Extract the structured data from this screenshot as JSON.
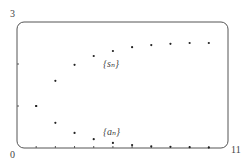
{
  "chart_data": {
    "type": "scatter",
    "title": "",
    "xlabel": "",
    "ylabel": "",
    "xlim": [
      0,
      11
    ],
    "ylim": [
      0,
      3
    ],
    "grid": false,
    "tick_labels": {
      "y_max": "3",
      "origin": "0",
      "x_max": "11"
    },
    "y_ticks": [
      1,
      2
    ],
    "x_ticks": [
      1,
      2,
      3,
      4,
      5,
      6,
      7,
      8,
      9,
      10
    ],
    "series": [
      {
        "name": "{s_n}",
        "label": "{sₙ}",
        "x": [
          1,
          2,
          3,
          4,
          5,
          6,
          7,
          8,
          9,
          10
        ],
        "values": [
          1.0,
          1.6,
          1.98,
          2.19,
          2.31,
          2.4,
          2.45,
          2.48,
          2.5,
          2.5
        ]
      },
      {
        "name": "{a_n}",
        "label": "{aₙ}",
        "x": [
          1,
          2,
          3,
          4,
          5,
          6,
          7,
          8,
          9,
          10
        ],
        "values": [
          1.0,
          0.6,
          0.36,
          0.21,
          0.12,
          0.07,
          0.04,
          0.03,
          0.02,
          0.01
        ]
      }
    ],
    "annotations": [
      {
        "text": "{sₙ}",
        "near_x": 4.7,
        "near_y": 2.0
      },
      {
        "text": "{aₙ}",
        "near_x": 4.7,
        "near_y": 0.4
      }
    ],
    "colors": {
      "frame": "#555555",
      "points": "#222222"
    }
  }
}
